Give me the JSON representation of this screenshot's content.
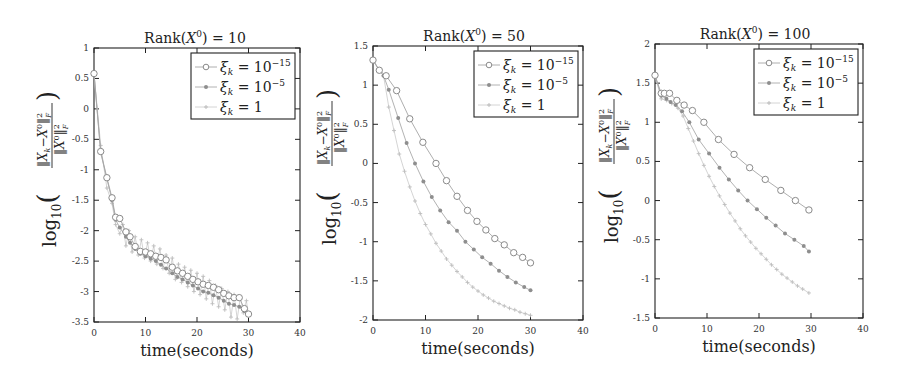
{
  "chart_data": [
    {
      "type": "line",
      "title": "Rank(X⁰) = 10",
      "xlabel": "time(seconds)",
      "ylabel": "log10( ||X_k − X⁰||_F² / ||X⁰||_F² )",
      "xlim": [
        0,
        40
      ],
      "ylim": [
        -3.5,
        1
      ],
      "xticks": [
        0,
        10,
        20,
        30,
        40
      ],
      "yticks": [
        1,
        0.5,
        0,
        -0.5,
        -1,
        -1.5,
        -2,
        -2.5,
        -3,
        -3.5
      ],
      "ytick_labels": [
        "1",
        "0.5",
        "0",
        "-0.5",
        "-1",
        "-1.5",
        "-2",
        "-2.5",
        "-3",
        "-3.5"
      ],
      "grid": false,
      "legend_position": "upper right",
      "series": [
        {
          "name": "ξ_k = 10^-15",
          "marker": "circle",
          "x": [
            0,
            1.3,
            2.5,
            3.5,
            4.2,
            5.0,
            6.2,
            7.0,
            8.0,
            9.0,
            10.0,
            11.0,
            12.0,
            13.0,
            14.0,
            15.2,
            16.2,
            17.2,
            18.2,
            19.2,
            20.2,
            21.2,
            22.2,
            23.2,
            24.2,
            25.2,
            26.2,
            27.2,
            28.2,
            29.2,
            30.0
          ],
          "y": [
            0.58,
            -0.7,
            -1.13,
            -1.46,
            -1.78,
            -1.8,
            -2.02,
            -2.1,
            -2.26,
            -2.34,
            -2.35,
            -2.38,
            -2.42,
            -2.44,
            -2.48,
            -2.6,
            -2.66,
            -2.7,
            -2.75,
            -2.8,
            -2.84,
            -2.88,
            -2.9,
            -2.93,
            -2.97,
            -3.03,
            -3.07,
            -3.1,
            -3.1,
            -3.28,
            -3.37
          ]
        },
        {
          "name": "ξ_k = 10^-5",
          "marker": "dot",
          "x": [
            0,
            1.3,
            2.5,
            3.5,
            4.2,
            5.0,
            6.2,
            7.0,
            8.0,
            9.0,
            10.0,
            11.0,
            12.0,
            13.0,
            14.0,
            15.2,
            16.2,
            17.2,
            18.2,
            19.2,
            20.2,
            21.2,
            22.2,
            23.2,
            24.2,
            25.2,
            26.2,
            27.2,
            28.2,
            29.2,
            30.0
          ],
          "y": [
            0.58,
            -0.72,
            -1.15,
            -1.5,
            -1.82,
            -1.95,
            -2.1,
            -2.2,
            -2.3,
            -2.38,
            -2.42,
            -2.46,
            -2.5,
            -2.56,
            -2.62,
            -2.7,
            -2.76,
            -2.8,
            -2.85,
            -2.9,
            -2.95,
            -3.0,
            -3.02,
            -3.06,
            -3.1,
            -3.15,
            -3.2,
            -3.22,
            -3.25,
            -3.32,
            -3.38
          ]
        },
        {
          "name": "ξ_k = 1",
          "marker": "plus",
          "x": [
            0,
            1.3,
            2.5,
            3.5,
            4.2,
            5.0,
            5.6,
            6.2,
            6.8,
            7.4,
            8.0,
            8.6,
            9.2,
            9.8,
            10.4,
            11.0,
            11.6,
            12.2,
            12.8,
            13.4,
            14.0,
            14.6,
            15.2,
            15.8,
            16.4,
            17.0,
            17.6,
            18.2,
            18.8,
            19.4,
            20.0,
            20.6,
            21.2,
            21.8,
            22.4,
            23.0,
            23.6,
            24.2,
            24.8,
            25.4,
            26.0,
            26.6,
            27.2,
            27.8,
            28.4,
            29.0,
            29.6,
            30.0
          ],
          "y": [
            0.58,
            -0.6,
            -1.3,
            -1.55,
            -1.9,
            -2.05,
            -1.9,
            -2.25,
            -2.0,
            -2.35,
            -2.1,
            -2.4,
            -2.15,
            -2.45,
            -2.2,
            -2.5,
            -2.25,
            -2.55,
            -2.3,
            -2.62,
            -2.4,
            -2.7,
            -2.45,
            -2.8,
            -2.55,
            -2.85,
            -2.6,
            -2.92,
            -2.65,
            -3.0,
            -2.7,
            -3.05,
            -2.75,
            -3.12,
            -2.82,
            -3.2,
            -2.9,
            -3.25,
            -2.95,
            -3.3,
            -3.0,
            -3.42,
            -3.05,
            -3.45,
            -3.1,
            -3.35,
            -3.15,
            -3.4
          ]
        }
      ]
    },
    {
      "type": "line",
      "title": "Rank(X⁰) = 50",
      "xlabel": "time(seconds)",
      "ylabel": "log10( ||X_k − X⁰||_F² / ||X⁰||_F² )",
      "xlim": [
        0,
        40
      ],
      "ylim": [
        -2,
        1.5
      ],
      "xticks": [
        0,
        10,
        20,
        30,
        40
      ],
      "yticks": [
        1.5,
        1,
        0.5,
        0,
        -0.5,
        -1,
        -1.5,
        -2
      ],
      "ytick_labels": [
        "1.5",
        "1",
        "0.5",
        "0",
        "-0.5",
        "-1",
        "-1.5",
        "-2"
      ],
      "grid": false,
      "legend_position": "upper right",
      "series": [
        {
          "name": "ξ_k = 10^-15",
          "marker": "circle",
          "x": [
            0,
            1.2,
            2.5,
            4.5,
            7.0,
            9.5,
            12.0,
            14.0,
            16.0,
            18.0,
            19.8,
            21.5,
            23.2,
            25.0,
            26.8,
            28.5,
            30.0
          ],
          "y": [
            1.32,
            1.19,
            1.12,
            0.93,
            0.57,
            0.27,
            0.0,
            -0.22,
            -0.42,
            -0.6,
            -0.74,
            -0.85,
            -0.96,
            -1.04,
            -1.14,
            -1.2,
            -1.27
          ]
        },
        {
          "name": "ξ_k = 10^-5",
          "marker": "dot",
          "x": [
            0,
            1.2,
            2.0,
            3.0,
            4.8,
            6.4,
            8.0,
            9.6,
            11.2,
            12.8,
            14.4,
            16.0,
            17.6,
            19.2,
            20.8,
            22.4,
            24.0,
            25.6,
            27.2,
            28.8,
            30.0
          ],
          "y": [
            1.32,
            1.19,
            1.12,
            0.94,
            0.58,
            0.26,
            0.0,
            -0.23,
            -0.43,
            -0.6,
            -0.75,
            -0.86,
            -1.0,
            -1.1,
            -1.2,
            -1.28,
            -1.37,
            -1.45,
            -1.52,
            -1.58,
            -1.62
          ]
        },
        {
          "name": "ξ_k = 1",
          "marker": "plus",
          "x": [
            0,
            1.2,
            2.0,
            3.0,
            4.0,
            5.0,
            6.0,
            7.0,
            8.0,
            9.0,
            10.0,
            11.0,
            12.0,
            13.0,
            14.0,
            15.0,
            16.0,
            17.0,
            18.0,
            19.0,
            20.0,
            21.0,
            22.0,
            23.0,
            24.0,
            25.0,
            26.0,
            27.0,
            28.0,
            29.0,
            30.0
          ],
          "y": [
            1.32,
            1.19,
            1.12,
            0.72,
            0.42,
            0.12,
            -0.1,
            -0.3,
            -0.48,
            -0.64,
            -0.78,
            -0.9,
            -1.02,
            -1.12,
            -1.22,
            -1.3,
            -1.38,
            -1.45,
            -1.52,
            -1.58,
            -1.63,
            -1.68,
            -1.72,
            -1.76,
            -1.79,
            -1.82,
            -1.85,
            -1.87,
            -1.9,
            -1.92,
            -1.94
          ]
        }
      ]
    },
    {
      "type": "line",
      "title": "Rank(X⁰) = 100",
      "xlabel": "time(seconds)",
      "ylabel": "log10( ||X_k − X⁰||_F² / ||X⁰||_F² )",
      "xlim": [
        0,
        40
      ],
      "ylim": [
        -1.5,
        2
      ],
      "xticks": [
        0,
        10,
        20,
        30,
        40
      ],
      "yticks": [
        2,
        1.5,
        1,
        0.5,
        0,
        -0.5,
        -1,
        -1.5
      ],
      "ytick_labels": [
        "2",
        "1.5",
        "1",
        "0.5",
        "0",
        "-0.5",
        "-1",
        "-1.5"
      ],
      "grid": false,
      "legend_position": "upper right",
      "series": [
        {
          "name": "ξ_k = 10^-15",
          "marker": "circle",
          "x": [
            0,
            1.2,
            1.8,
            2.8,
            4.2,
            5.6,
            7.2,
            9.4,
            12.2,
            15.2,
            18.2,
            21.2,
            24.2,
            27.0,
            29.6
          ],
          "y": [
            1.6,
            1.37,
            1.37,
            1.37,
            1.28,
            1.22,
            1.15,
            1.0,
            0.78,
            0.59,
            0.42,
            0.27,
            0.13,
            0.0,
            -0.12
          ]
        },
        {
          "name": "ξ_k = 10^-5",
          "marker": "dot",
          "x": [
            0,
            1.2,
            2.2,
            3.0,
            4.0,
            5.2,
            6.6,
            8.4,
            10.4,
            12.4,
            14.2,
            16.0,
            17.8,
            19.6,
            21.4,
            23.2,
            25.0,
            26.8,
            28.6,
            29.6
          ],
          "y": [
            1.6,
            1.34,
            1.3,
            1.26,
            1.22,
            1.14,
            1.0,
            0.78,
            0.6,
            0.42,
            0.27,
            0.13,
            0.0,
            -0.11,
            -0.22,
            -0.32,
            -0.42,
            -0.5,
            -0.58,
            -0.65
          ]
        },
        {
          "name": "ξ_k = 1",
          "marker": "plus",
          "x": [
            0,
            1.2,
            2.2,
            3.2,
            4.4,
            5.4,
            6.4,
            7.4,
            8.4,
            9.4,
            10.4,
            11.4,
            12.4,
            13.4,
            14.4,
            15.4,
            16.4,
            17.4,
            18.4,
            19.4,
            20.4,
            21.4,
            22.4,
            23.4,
            24.4,
            25.4,
            26.4,
            27.4,
            28.4,
            29.6
          ],
          "y": [
            1.6,
            1.3,
            1.28,
            1.24,
            1.18,
            1.08,
            0.92,
            0.76,
            0.6,
            0.45,
            0.31,
            0.18,
            0.06,
            -0.05,
            -0.16,
            -0.26,
            -0.36,
            -0.45,
            -0.53,
            -0.61,
            -0.68,
            -0.75,
            -0.82,
            -0.88,
            -0.94,
            -0.99,
            -1.04,
            -1.09,
            -1.13,
            -1.18
          ]
        }
      ]
    }
  ],
  "legend_labels": [
    {
      "xi": "ξ",
      "sub": "k",
      "eq": " = 10",
      "sup": "−15"
    },
    {
      "xi": "ξ",
      "sub": "k",
      "eq": " = 10",
      "sup": "−5"
    },
    {
      "xi": "ξ",
      "sub": "k",
      "eq": " = 1",
      "sup": ""
    }
  ],
  "ylabel_parts": {
    "log": "log",
    "log_sub": "10",
    "numerator": "‖X",
    "num_sub": "k",
    "num_mid": "−X",
    "num_sup0": "0",
    "num_end": "‖",
    "num_sup2": "2",
    "num_subF": "F",
    "denominator": "‖X",
    "den_sup0": "0",
    "den_end": "‖",
    "den_sup2": "2",
    "den_subF": "F"
  },
  "title_parts": [
    {
      "pre": "Rank(",
      "var": "X",
      "sup": "0",
      "post": ") = 10"
    },
    {
      "pre": "Rank(",
      "var": "X",
      "sup": "0",
      "post": ") = 50"
    },
    {
      "pre": "Rank(",
      "var": "X",
      "sup": "0",
      "post": ") = 100"
    }
  ],
  "colors": {
    "axis": "#222222",
    "series_circle": "#8a8a8a",
    "series_dot": "#8e8e8e",
    "series_plus": "#bdbdbd",
    "line_circle": "#a5a5a5",
    "line_dot": "#a9a9a9",
    "line_plus": "#cfcfcf"
  }
}
